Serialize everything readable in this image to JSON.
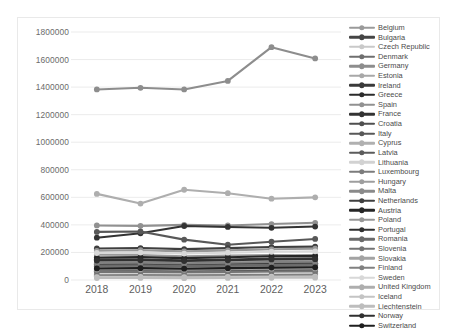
{
  "watermark": "",
  "chart_data": {
    "type": "line",
    "title": "",
    "xlabel": "",
    "ylabel": "",
    "x": [
      "2018",
      "2019",
      "2020",
      "2021",
      "2022",
      "2023"
    ],
    "categories": [
      "2018",
      "2019",
      "2020",
      "2021",
      "2022",
      "2023"
    ],
    "ylim": [
      0,
      1800000
    ],
    "ytick_labels": [
      "0",
      "200000",
      "400000",
      "600000",
      "800000",
      "1000000",
      "1200000",
      "1400000",
      "1600000",
      "1800000"
    ],
    "ytick_values": [
      0,
      200000,
      400000,
      600000,
      800000,
      1000000,
      1200000,
      1400000,
      1600000,
      1800000
    ],
    "grid": true,
    "legend_position": "right",
    "markers": "circle",
    "series": [
      {
        "name": "Belgium",
        "color": "#9a9a9a",
        "values": [
          183000,
          181000,
          172000,
          177000,
          181000,
          179000
        ]
      },
      {
        "name": "Bulgaria",
        "color": "#454545",
        "values": [
          68000,
          71000,
          66000,
          70000,
          75000,
          77000
        ]
      },
      {
        "name": "Czech Republic",
        "color": "#c9c9c9",
        "values": [
          131000,
          134000,
          129000,
          133000,
          137000,
          139000
        ]
      },
      {
        "name": "Denmark",
        "color": "#6f6f6f",
        "values": [
          99000,
          100000,
          97000,
          101000,
          104000,
          105000
        ]
      },
      {
        "name": "Germany",
        "color": "#8d8d8d",
        "values": [
          1383000,
          1395000,
          1383000,
          1445000,
          1690000,
          1608000
        ]
      },
      {
        "name": "Estonia",
        "color": "#a8a8a8",
        "values": [
          52000,
          53000,
          51000,
          54000,
          57000,
          58000
        ]
      },
      {
        "name": "Ireland",
        "color": "#3a3a3a",
        "values": [
          151000,
          148000,
          143000,
          149000,
          156000,
          158000
        ]
      },
      {
        "name": "Greece",
        "color": "#2b2b2b",
        "values": [
          118000,
          115000,
          110000,
          114000,
          119000,
          121000
        ]
      },
      {
        "name": "Spain",
        "color": "#919191",
        "values": [
          396000,
          393000,
          400000,
          396000,
          406000,
          415000
        ]
      },
      {
        "name": "France",
        "color": "#333333",
        "values": [
          307000,
          339000,
          392000,
          385000,
          379000,
          388000
        ]
      },
      {
        "name": "Croatia",
        "color": "#4f4f4f",
        "values": [
          61000,
          63000,
          60000,
          63000,
          66000,
          68000
        ]
      },
      {
        "name": "Italy",
        "color": "#585858",
        "values": [
          349000,
          352000,
          293000,
          256000,
          278000,
          298000
        ]
      },
      {
        "name": "Cyprus",
        "color": "#b0b0b0",
        "values": [
          44000,
          45000,
          43000,
          46000,
          48000,
          49000
        ]
      },
      {
        "name": "Latvia",
        "color": "#5c5c5c",
        "values": [
          39000,
          40000,
          38000,
          40000,
          42000,
          43000
        ]
      },
      {
        "name": "Lithuania",
        "color": "#d2d2d2",
        "values": [
          46000,
          47000,
          45000,
          47000,
          50000,
          51000
        ]
      },
      {
        "name": "Luxembourg",
        "color": "#7c7c7c",
        "values": [
          33000,
          34000,
          32000,
          34000,
          36000,
          37000
        ]
      },
      {
        "name": "Hungary",
        "color": "#9e9e9e",
        "values": [
          88000,
          90000,
          86000,
          90000,
          94000,
          96000
        ]
      },
      {
        "name": "Malta",
        "color": "#8a8a8a",
        "values": [
          27000,
          28000,
          26000,
          28000,
          30000,
          31000
        ]
      },
      {
        "name": "Netherlands",
        "color": "#3f3f3f",
        "values": [
          229000,
          232000,
          224000,
          231000,
          239000,
          242000
        ]
      },
      {
        "name": "Austria",
        "color": "#262626",
        "values": [
          163000,
          166000,
          159000,
          165000,
          172000,
          175000
        ]
      },
      {
        "name": "Poland",
        "color": "#989898",
        "values": [
          212000,
          216000,
          208000,
          215000,
          223000,
          227000
        ]
      },
      {
        "name": "Portugal",
        "color": "#2f2f2f",
        "values": [
          112000,
          114000,
          109000,
          114000,
          119000,
          121000
        ]
      },
      {
        "name": "Romania",
        "color": "#6a6a6a",
        "values": [
          104000,
          106000,
          101000,
          106000,
          111000,
          113000
        ]
      },
      {
        "name": "Slovenia",
        "color": "#747474",
        "values": [
          58000,
          59000,
          56000,
          59000,
          62000,
          63000
        ]
      },
      {
        "name": "Slovakia",
        "color": "#a3a3a3",
        "values": [
          76000,
          78000,
          74000,
          78000,
          82000,
          84000
        ]
      },
      {
        "name": "Finland",
        "color": "#818181",
        "values": [
          124000,
          126000,
          121000,
          126000,
          131000,
          133000
        ]
      },
      {
        "name": "Sweden",
        "color": "#d8d8d8",
        "values": [
          196000,
          199000,
          192000,
          198000,
          205000,
          208000
        ]
      },
      {
        "name": "United Kingdom",
        "color": "#aeaeae",
        "values": [
          625000,
          555000,
          655000,
          630000,
          590000,
          600000
        ]
      },
      {
        "name": "Iceland",
        "color": "#c4c4c4",
        "values": [
          21000,
          22000,
          20000,
          22000,
          24000,
          25000
        ]
      },
      {
        "name": "Liechtenstein",
        "color": "#bdbdbd",
        "values": [
          14000,
          15000,
          13000,
          15000,
          16000,
          17000
        ]
      },
      {
        "name": "Norway",
        "color": "#303030",
        "values": [
          141000,
          143000,
          138000,
          143000,
          149000,
          151000
        ]
      },
      {
        "name": "Switzerland",
        "color": "#1f1f1f",
        "values": [
          84000,
          86000,
          82000,
          86000,
          90000,
          92000
        ]
      }
    ]
  }
}
